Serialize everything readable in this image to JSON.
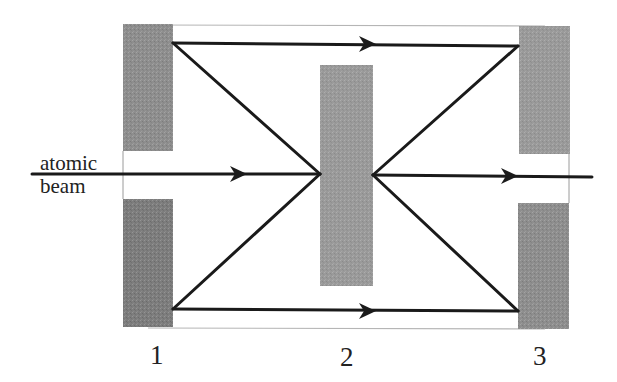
{
  "diagram": {
    "beam_label_line1": "atomic",
    "beam_label_line2": "beam",
    "plate_labels": [
      "1",
      "2",
      "3"
    ],
    "colors": {
      "plate_fill": "#8f8f8f",
      "plate_fill_dark": "#7a7a7a",
      "frame_line": "#b5b5b5",
      "trajectory": "#1a1a1a",
      "background": "#ffffff"
    }
  }
}
